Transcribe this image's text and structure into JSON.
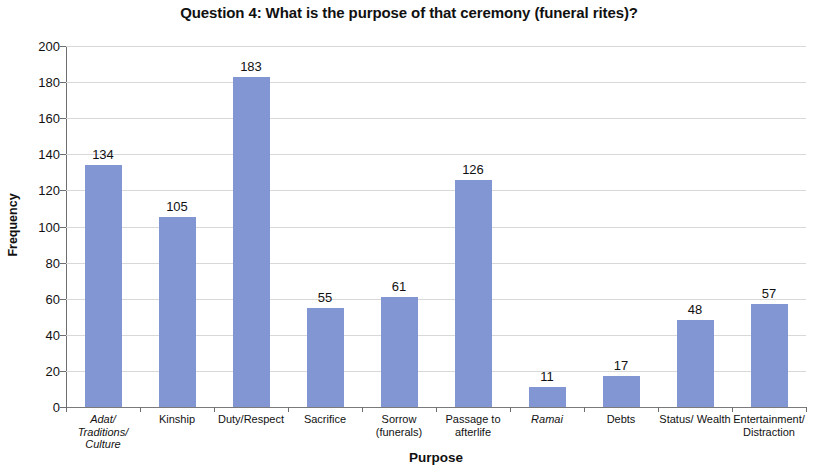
{
  "chart_data": {
    "type": "bar",
    "title": "Question 4: What is the purpose of that ceremony (funeral rites)?",
    "xlabel": "Purpose",
    "ylabel": "Frequency",
    "ylim": [
      0,
      200
    ],
    "ytick_step": 20,
    "yticks": [
      0,
      20,
      40,
      60,
      80,
      100,
      120,
      140,
      160,
      180,
      200
    ],
    "grid": true,
    "legend": "none",
    "bar_color": "#8196d3",
    "gridline_color": "#d8d8d8",
    "axis_color": "#6e6e6e",
    "categories": [
      "Adat/ Traditions/ Culture",
      "Kinship",
      "Duty/Respect",
      "Sacrifice",
      "Sorrow (funerals)",
      "Passage to afterlife",
      "Ramai",
      "Debts",
      "Status/ Wealth",
      "Entertainment/ Distraction"
    ],
    "category_lines": [
      [
        "Adat/",
        "Traditions/",
        "Culture"
      ],
      [
        "Kinship"
      ],
      [
        "Duty/Respect"
      ],
      [
        "Sacrifice"
      ],
      [
        "Sorrow",
        "(funerals)"
      ],
      [
        "Passage to",
        "afterlife"
      ],
      [
        "Ramai"
      ],
      [
        "Debts"
      ],
      [
        "Status/ Wealth"
      ],
      [
        "Entertainment/",
        "Distraction"
      ]
    ],
    "category_italic": [
      true,
      false,
      false,
      false,
      false,
      false,
      true,
      false,
      false,
      false
    ],
    "values": [
      134,
      105,
      183,
      55,
      61,
      126,
      11,
      17,
      48,
      57
    ],
    "value_labels": [
      "134",
      "105",
      "183",
      "55",
      "61",
      "126",
      "11",
      "17",
      "48",
      "57"
    ]
  }
}
